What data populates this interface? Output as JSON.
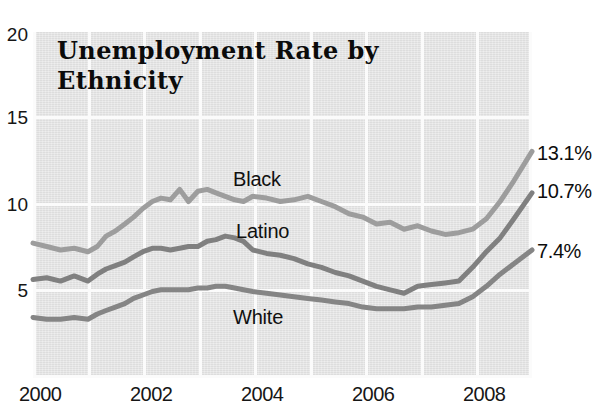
{
  "chart_data": {
    "type": "line",
    "title": "Unemployment Rate by Ethnicity",
    "xlabel": "",
    "ylabel": "",
    "xlim": [
      2000,
      2009.08
    ],
    "ylim": [
      0,
      20
    ],
    "yticks": [
      20,
      15,
      10,
      5
    ],
    "xticks": [
      2000,
      2002,
      2004,
      2006,
      2008
    ],
    "grid": true,
    "legend_position": "inline-annotations",
    "background_color": "#e3e3e3",
    "gridline_color": "#fbfbfb",
    "series": [
      {
        "name": "Black",
        "color": "#9d9d9d",
        "end_value_label": "13.1%",
        "x": [
          2000.0,
          2000.25,
          2000.5,
          2000.75,
          2001.0,
          2001.17,
          2001.33,
          2001.5,
          2001.67,
          2001.83,
          2002.0,
          2002.17,
          2002.33,
          2002.5,
          2002.67,
          2002.83,
          2003.0,
          2003.17,
          2003.33,
          2003.5,
          2003.67,
          2003.83,
          2004.0,
          2004.25,
          2004.5,
          2004.75,
          2005.0,
          2005.25,
          2005.5,
          2005.75,
          2006.0,
          2006.25,
          2006.5,
          2006.75,
          2007.0,
          2007.25,
          2007.5,
          2007.75,
          2008.0,
          2008.25,
          2008.5,
          2008.75,
          2009.08
        ],
        "y": [
          7.8,
          7.6,
          7.4,
          7.5,
          7.3,
          7.6,
          8.2,
          8.5,
          8.9,
          9.3,
          9.8,
          10.2,
          10.4,
          10.3,
          10.9,
          10.2,
          10.8,
          10.9,
          10.7,
          10.5,
          10.3,
          10.2,
          10.5,
          10.4,
          10.2,
          10.3,
          10.5,
          10.2,
          9.9,
          9.5,
          9.3,
          8.9,
          9.0,
          8.6,
          8.8,
          8.5,
          8.3,
          8.4,
          8.6,
          9.2,
          10.2,
          11.4,
          13.1
        ]
      },
      {
        "name": "Latino",
        "color": "#808080",
        "end_value_label": "10.7%",
        "x": [
          2000.0,
          2000.25,
          2000.5,
          2000.75,
          2001.0,
          2001.17,
          2001.33,
          2001.5,
          2001.67,
          2001.83,
          2002.0,
          2002.17,
          2002.33,
          2002.5,
          2002.67,
          2002.83,
          2003.0,
          2003.17,
          2003.33,
          2003.5,
          2003.67,
          2003.83,
          2004.0,
          2004.25,
          2004.5,
          2004.75,
          2005.0,
          2005.25,
          2005.5,
          2005.75,
          2006.0,
          2006.25,
          2006.5,
          2006.75,
          2007.0,
          2007.25,
          2007.5,
          2007.75,
          2008.0,
          2008.25,
          2008.5,
          2008.75,
          2009.08
        ],
        "y": [
          5.7,
          5.8,
          5.6,
          5.9,
          5.6,
          6.0,
          6.3,
          6.5,
          6.7,
          7.0,
          7.3,
          7.5,
          7.5,
          7.4,
          7.5,
          7.6,
          7.6,
          7.9,
          8.0,
          8.2,
          8.1,
          7.9,
          7.4,
          7.2,
          7.1,
          6.9,
          6.6,
          6.4,
          6.1,
          5.9,
          5.6,
          5.3,
          5.1,
          4.9,
          5.3,
          5.4,
          5.5,
          5.6,
          6.4,
          7.3,
          8.1,
          9.2,
          10.7
        ]
      },
      {
        "name": "White",
        "color": "#858585",
        "end_value_label": "7.4%",
        "x": [
          2000.0,
          2000.25,
          2000.5,
          2000.75,
          2001.0,
          2001.17,
          2001.33,
          2001.5,
          2001.67,
          2001.83,
          2002.0,
          2002.17,
          2002.33,
          2002.5,
          2002.67,
          2002.83,
          2003.0,
          2003.17,
          2003.33,
          2003.5,
          2003.67,
          2003.83,
          2004.0,
          2004.25,
          2004.5,
          2004.75,
          2005.0,
          2005.25,
          2005.5,
          2005.75,
          2006.0,
          2006.25,
          2006.5,
          2006.75,
          2007.0,
          2007.25,
          2007.5,
          2007.75,
          2008.0,
          2008.25,
          2008.5,
          2008.75,
          2009.08
        ],
        "y": [
          3.5,
          3.4,
          3.4,
          3.5,
          3.4,
          3.7,
          3.9,
          4.1,
          4.3,
          4.6,
          4.8,
          5.0,
          5.1,
          5.1,
          5.1,
          5.1,
          5.2,
          5.2,
          5.3,
          5.3,
          5.2,
          5.1,
          5.0,
          4.9,
          4.8,
          4.7,
          4.6,
          4.5,
          4.4,
          4.3,
          4.1,
          4.0,
          4.0,
          4.0,
          4.1,
          4.1,
          4.2,
          4.3,
          4.7,
          5.3,
          6.0,
          6.6,
          7.4
        ]
      }
    ],
    "annotations": [
      {
        "text": "Black",
        "x_px": 233,
        "y_px": 180
      },
      {
        "text": "Latino",
        "x_px": 236,
        "y_px": 232
      },
      {
        "text": "White",
        "x_px": 233,
        "y_px": 318
      }
    ]
  },
  "axis": {
    "y_labels": [
      "20",
      "15",
      "10",
      "5"
    ],
    "x_labels": [
      "2000",
      "2002",
      "2004",
      "2006",
      "2008"
    ]
  },
  "title": {
    "line1": "Unemployment Rate by",
    "line2": "Ethnicity",
    "full": "Unemployment Rate by Ethnicity"
  }
}
